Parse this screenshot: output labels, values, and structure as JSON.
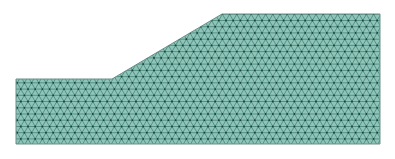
{
  "diagram": {
    "type": "finite-element-mesh",
    "element_type": "triangular",
    "geometry": {
      "outline": [
        [
          16,
          79
        ],
        [
          112,
          79
        ],
        [
          222,
          14
        ],
        [
          380,
          14
        ],
        [
          380,
          144
        ],
        [
          16,
          144
        ]
      ],
      "left_block": {
        "x0": 16,
        "x1": 112,
        "y_top": 79,
        "y_bottom": 144
      },
      "slope": {
        "from": [
          112,
          79
        ],
        "to": [
          222,
          14
        ]
      },
      "crest": {
        "x0": 222,
        "x1": 380,
        "y": 14
      }
    },
    "mesh": {
      "spacing": 7.2
    },
    "colors": {
      "fill": "#8fc4b8",
      "edge": "#2f6e64",
      "node": "#16423c",
      "outline": "#6b8f88",
      "background": "#ffffff"
    }
  }
}
